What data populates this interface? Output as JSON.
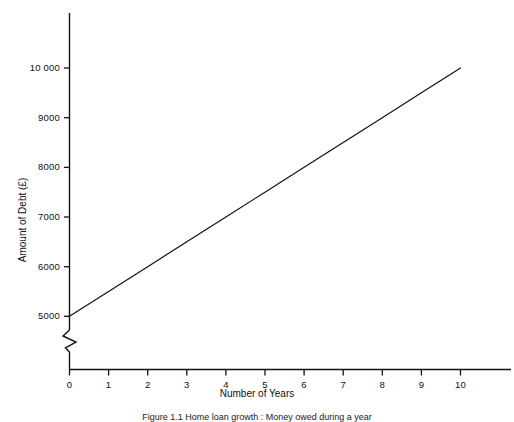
{
  "figure": {
    "caption": "Figure 1.1   Home loan growth : Money owed during a year",
    "background_color": "#ffffff",
    "ink_color": "#111111"
  },
  "axes": {
    "y_axis": {
      "title": "Amount of Debt (£)",
      "tick_labels": [
        "5000",
        "6000",
        "7000",
        "8000",
        "9000",
        "10 000"
      ],
      "tick_values": [
        5000,
        6000,
        7000,
        8000,
        9000,
        10000
      ],
      "has_axis_break": true,
      "axis_break_icon": "zigzag-break-icon"
    },
    "x_axis": {
      "title": "Number of Years",
      "tick_labels": [
        "0",
        "1",
        "2",
        "3",
        "4",
        "5",
        "6",
        "7",
        "8",
        "9",
        "10"
      ],
      "tick_values": [
        0,
        1,
        2,
        3,
        4,
        5,
        6,
        7,
        8,
        9,
        10
      ]
    }
  },
  "chart_data": {
    "type": "line",
    "title": "",
    "subtitle": "",
    "xlabel": "Number of Years",
    "ylabel": "Amount of Debt (£)",
    "xlim": [
      0,
      11
    ],
    "ylim": [
      5000,
      10200
    ],
    "xticks": [
      0,
      1,
      2,
      3,
      4,
      5,
      6,
      7,
      8,
      9,
      10
    ],
    "yticks": [
      5000,
      6000,
      7000,
      8000,
      9000,
      10000
    ],
    "ytick_labels": [
      "5000",
      "6000",
      "7000",
      "8000",
      "9000",
      "10 000"
    ],
    "xtick_labels": [
      "0",
      "1",
      "2",
      "3",
      "4",
      "5",
      "6",
      "7",
      "8",
      "9",
      "10"
    ],
    "grid": false,
    "legend": null,
    "legend_position": "none",
    "axis_break_y": true,
    "series": [
      {
        "name": "Amount of Debt",
        "color": "#111111",
        "line_width": 1.2,
        "marker": "none",
        "x": [
          0,
          1,
          2,
          3,
          4,
          5,
          6,
          7,
          8,
          9,
          10
        ],
        "values": [
          5000,
          5500,
          6000,
          6500,
          7000,
          7500,
          8000,
          8500,
          9000,
          9500,
          10000
        ]
      }
    ],
    "annotations": []
  }
}
